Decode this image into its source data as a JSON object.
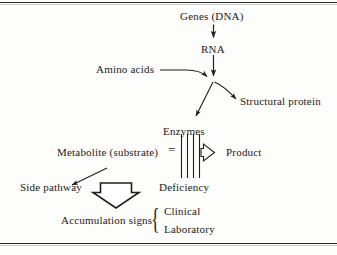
{
  "figure": {
    "background_color": "#fdfdfb",
    "line_color": "#2b2b2b",
    "text_color": "#1a1a1a"
  },
  "nodes": {
    "genes": "Genes (DNA)",
    "rna": "RNA",
    "amino_acids": "Amino acids",
    "structural_protein": "Structural protein",
    "enzymes": "Enzymes",
    "metabolite": "Metabolite (substrate)",
    "product": "Product",
    "side_pathway": "Side pathway",
    "deficiency": "Deficiency",
    "accumulation_signs": "Accumulation signs",
    "clinical": "Clinical",
    "laboratory": "Laboratory"
  },
  "symbols": {
    "equilibrium": "=",
    "brace": "{",
    "block_bars_count": 4
  },
  "edges": [
    {
      "name": "genes-to-rna",
      "from": "Genes (DNA)",
      "to": "RNA",
      "style": "straight-arrow-down"
    },
    {
      "name": "rna-to-junction",
      "from": "RNA",
      "to": "junction",
      "style": "straight-arrow-down"
    },
    {
      "name": "amino-acids-to-junction",
      "from": "Amino acids",
      "to": "junction",
      "style": "line-arrow-right"
    },
    {
      "name": "junction-to-enzymes",
      "from": "junction",
      "to": "Enzymes",
      "style": "curved-arrow-down-left"
    },
    {
      "name": "junction-to-structural-protein",
      "from": "junction",
      "to": "Structural protein",
      "style": "curved-arrow-down-right"
    },
    {
      "name": "metabolite-to-product",
      "from": "Metabolite (substrate)",
      "to": "Product",
      "style": "hollow-arrow-right-blocked"
    },
    {
      "name": "metabolite-to-side-pathway",
      "from": "Metabolite (substrate)",
      "to": "Side pathway",
      "style": "thin-arrow-up-left"
    },
    {
      "name": "to-accumulation-signs",
      "from": "Side pathway",
      "to": "Accumulation signs",
      "style": "large-hollow-arrow-down"
    }
  ]
}
